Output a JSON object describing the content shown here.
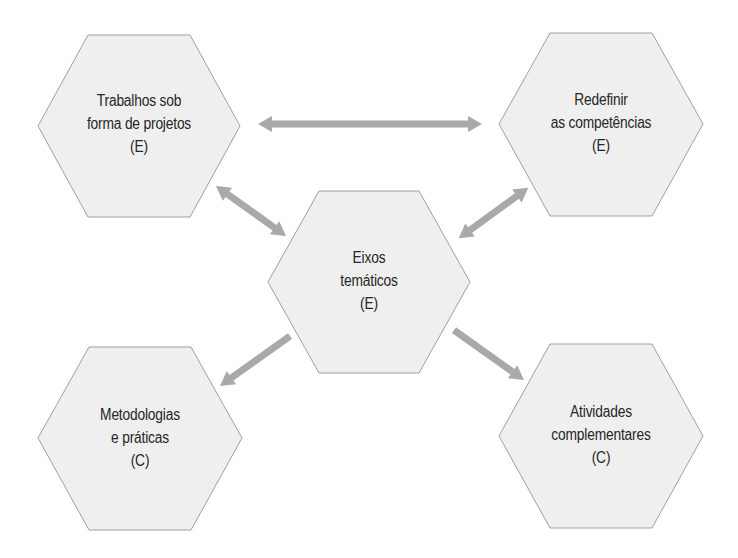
{
  "diagram": {
    "colors": {
      "hex_fill": "#efefef",
      "hex_stroke": "#a0a0a0",
      "arrow": "#a9a9a9",
      "text": "#262626",
      "background": "#ffffff"
    },
    "nodes": [
      {
        "id": "trabalhos",
        "position": "top-left",
        "lines": [
          "Trabalhos sob",
          "forma de projetos",
          "(E)"
        ]
      },
      {
        "id": "redefinir",
        "position": "top-right",
        "lines": [
          "Redefinir",
          "as competências",
          "(E)"
        ]
      },
      {
        "id": "eixos",
        "position": "center",
        "lines": [
          "Eixos",
          "temáticos",
          "(E)"
        ]
      },
      {
        "id": "metodologias",
        "position": "bottom-left",
        "lines": [
          "Metodologias",
          "e práticas",
          "(C)"
        ]
      },
      {
        "id": "atividades",
        "position": "bottom-right",
        "lines": [
          "Atividades",
          "complementares",
          "(C)"
        ]
      }
    ],
    "edges": [
      {
        "from": "trabalhos",
        "to": "redefinir",
        "type": "bidirectional"
      },
      {
        "from": "trabalhos",
        "to": "eixos",
        "type": "bidirectional"
      },
      {
        "from": "redefinir",
        "to": "eixos",
        "type": "bidirectional"
      },
      {
        "from": "eixos",
        "to": "metodologias",
        "type": "directed"
      },
      {
        "from": "eixos",
        "to": "atividades",
        "type": "directed"
      }
    ]
  }
}
